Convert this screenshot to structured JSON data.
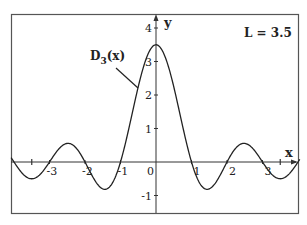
{
  "chart_data": {
    "type": "line",
    "title": "",
    "xlabel": "x",
    "ylabel": "y",
    "xlim": [
      -4.08,
      4.05
    ],
    "ylim": [
      -1.5,
      4.4
    ],
    "grid": false,
    "legend": "none",
    "x_ticks": [
      -3,
      -2,
      -1,
      0,
      1,
      2,
      3
    ],
    "x_minor_ticks": [
      -3.5,
      3.5
    ],
    "y_ticks": [
      -1,
      1,
      2,
      3,
      4
    ],
    "x_tick_labels": [
      "-3",
      "-2",
      "-1",
      "0",
      "1",
      "2",
      "3"
    ],
    "y_tick_labels": [
      "-1",
      "1",
      "2",
      "3",
      "4"
    ],
    "parameter_annotation": "L = 3.5",
    "series": [
      {
        "name": "D_3(x)",
        "label_main": "D",
        "label_sub": "3",
        "label_suffix": "(x)",
        "formula": "sin(pi*x) / (2*sin(pi*x/7))",
        "x": [
          -4.0,
          -3.5,
          -3.0,
          -2.5,
          -2.0,
          -1.5,
          -1.0,
          -0.5,
          0,
          0.5,
          1.0,
          1.5,
          2.0,
          2.5,
          3.0,
          3.5,
          4.0
        ],
        "values": [
          0.0,
          -0.5,
          0.0,
          0.555,
          0.0,
          -0.802,
          0.0,
          2.247,
          3.5,
          2.247,
          0.0,
          -0.802,
          0.0,
          0.555,
          0.0,
          -0.5,
          0.0
        ],
        "color": "#222222"
      }
    ],
    "annotations": [
      {
        "text": "D_3(x)",
        "pointer_to": [
          -0.5,
          2.25
        ]
      },
      {
        "text": "L = 3.5",
        "position": "top-right"
      }
    ]
  },
  "labels": {
    "x_axis": "x",
    "y_axis": "y",
    "param": "L = 3.5",
    "curve_main": "D",
    "curve_sub": "3",
    "curve_suffix": "(x)"
  }
}
